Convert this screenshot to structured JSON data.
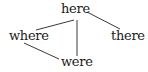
{
  "diagram": {
    "type": "tree",
    "nodes": [
      {
        "id": "here",
        "label": "here"
      },
      {
        "id": "where",
        "label": "where"
      },
      {
        "id": "there",
        "label": "there"
      },
      {
        "id": "were",
        "label": "were"
      }
    ],
    "edges": [
      {
        "from": "here",
        "to": "where"
      },
      {
        "from": "here",
        "to": "there"
      },
      {
        "from": "here",
        "to": "were"
      },
      {
        "from": "where",
        "to": "were"
      }
    ],
    "colors": {
      "background": "#ffffff",
      "text": "#1a1a1a",
      "edge": "#3a3a3a"
    }
  }
}
